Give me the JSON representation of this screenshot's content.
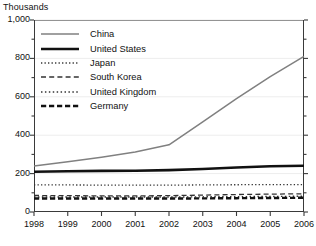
{
  "chart_data": {
    "type": "line",
    "title": "",
    "unit_label": "Thousands",
    "xlabel": "",
    "ylabel": "",
    "x": [
      1998,
      1999,
      2000,
      2001,
      2002,
      2003,
      2004,
      2005,
      2006
    ],
    "categories": [
      "1998",
      "1999",
      "2000",
      "2001",
      "2002",
      "2003",
      "2004",
      "2005",
      "2006"
    ],
    "ylim": [
      0,
      1000
    ],
    "xlim": [
      1998,
      2006
    ],
    "yticks": [
      0,
      200,
      400,
      600,
      800,
      1000
    ],
    "ytick_labels": [
      "0",
      "200",
      "400",
      "600",
      "800",
      "1,000"
    ],
    "yminor_step": 100,
    "grid": true,
    "grid_color": "#ededed",
    "legend_position": "upper-left-inside",
    "series": [
      {
        "name": "China",
        "style": "solid",
        "color": "#808080",
        "width": 1.5,
        "values": [
          240,
          262,
          285,
          312,
          350,
          470,
          590,
          705,
          810
        ]
      },
      {
        "name": "United States",
        "style": "solid",
        "color": "#111111",
        "width": 2.6,
        "values": [
          210,
          212,
          214,
          215,
          218,
          224,
          232,
          238,
          241
        ]
      },
      {
        "name": "Japan",
        "style": "fine-dotted",
        "color": "#333333",
        "width": 1.3,
        "values": [
          141,
          141,
          140,
          140,
          140,
          141,
          142,
          143,
          143
        ]
      },
      {
        "name": "South Korea",
        "style": "dashed",
        "color": "#333333",
        "width": 1.3,
        "values": [
          86,
          85,
          84,
          84,
          85,
          88,
          91,
          93,
          95
        ]
      },
      {
        "name": "United Kingdom",
        "style": "dotted",
        "color": "#333333",
        "width": 1.4,
        "values": [
          78,
          78,
          78,
          78,
          78,
          79,
          80,
          81,
          82
        ]
      },
      {
        "name": "Germany",
        "style": "bold-dashed",
        "color": "#111111",
        "width": 2.4,
        "values": [
          70,
          70,
          70,
          70,
          70,
          71,
          72,
          73,
          74
        ]
      }
    ]
  },
  "legend": {
    "items": [
      {
        "label": "China"
      },
      {
        "label": "United States"
      },
      {
        "label": "Japan"
      },
      {
        "label": "South Korea"
      },
      {
        "label": "United Kingdom"
      },
      {
        "label": "Germany"
      }
    ]
  }
}
